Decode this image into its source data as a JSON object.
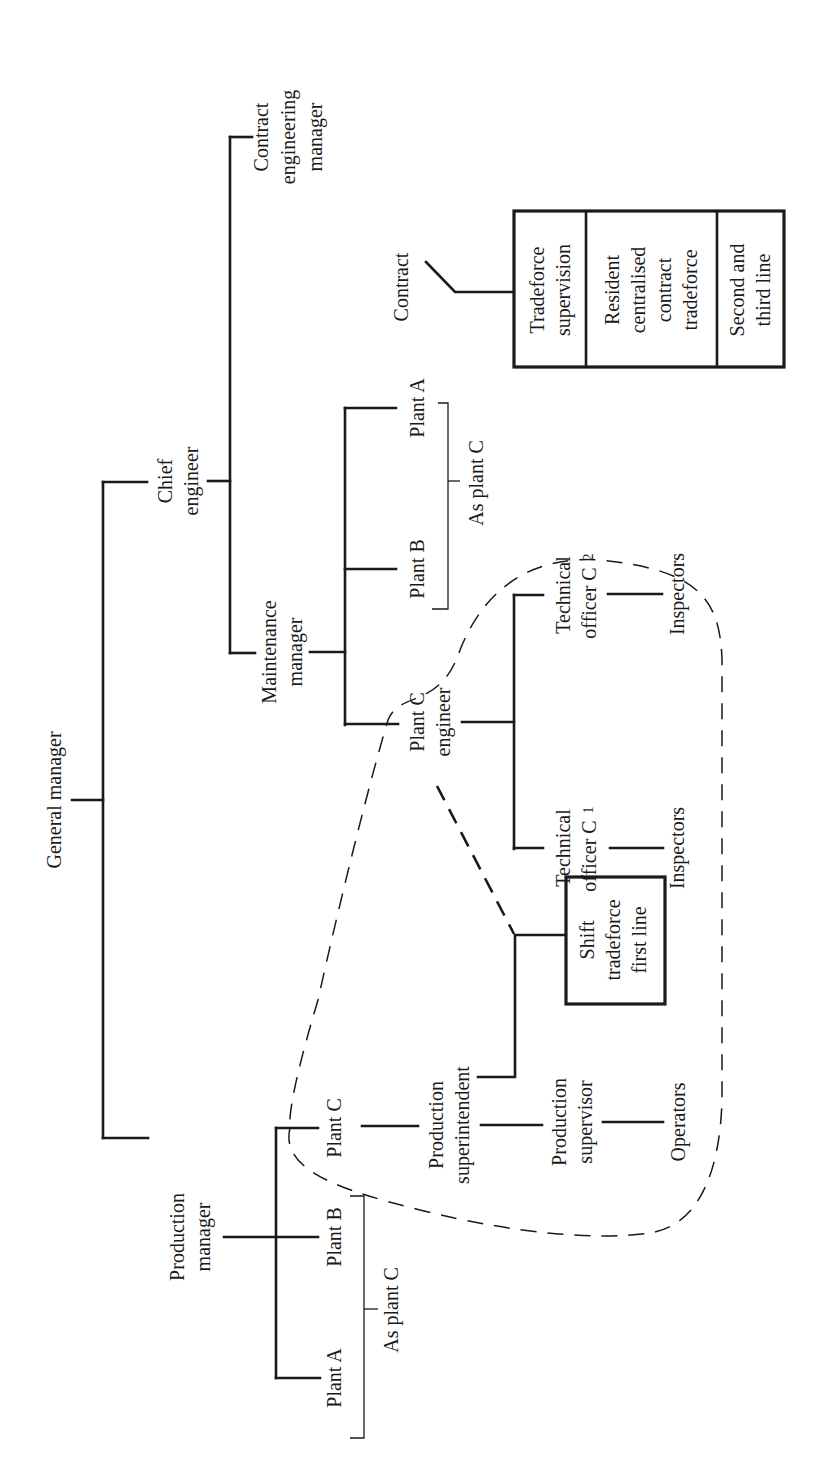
{
  "figure": {
    "orientation": "rotated-90-ccw",
    "line_color": "#1a1a1a",
    "background": "#ffffff"
  },
  "nodes": {
    "general_manager": "General manager",
    "chief_engineer": [
      "Chief",
      "engineer"
    ],
    "contract_engineering_manager": [
      "Contract",
      "engineering",
      "manager"
    ],
    "maintenance_manager": [
      "Maintenance",
      "manager"
    ],
    "maint_plant_a": "Plant A",
    "maint_plant_b": "Plant B",
    "maint_as_plant_c": "As plant C",
    "plant_c_engineer": [
      "Plant C",
      "engineer"
    ],
    "technical_officer_c1": [
      "Technical",
      "officer C"
    ],
    "technical_officer_c1_sub": "1",
    "technical_officer_c2": [
      "Technical",
      "officer C"
    ],
    "technical_officer_c2_sub": "2",
    "inspectors_1": "Inspectors",
    "inspectors_2": "Inspectors",
    "contract": "Contract",
    "contract_box": [
      [
        "Tradeforce",
        "supervision"
      ],
      [
        "Resident",
        "centralised",
        "contract",
        "tradeforce"
      ],
      [
        "Second and",
        "third line"
      ]
    ],
    "shift_tradeforce": [
      "Shift",
      "tradeforce",
      "first line"
    ],
    "production_manager": [
      "Production",
      "manager"
    ],
    "prod_plant_a": "Plant A",
    "prod_plant_b": "Plant B",
    "prod_as_plant_c": "As plant C",
    "prod_plant_c": "Plant C",
    "production_superintendent": [
      "Production",
      "superintendent"
    ],
    "production_supervisor": [
      "Production",
      "supervisor"
    ],
    "operators": "Operators"
  }
}
